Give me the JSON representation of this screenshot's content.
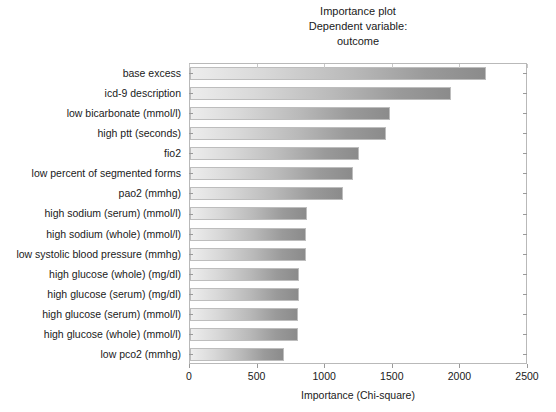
{
  "chart_data": {
    "type": "bar",
    "orientation": "horizontal",
    "title": "Importance plot\nDependent variable:\noutcome",
    "title_lines": [
      "Importance plot",
      "Dependent variable:",
      "outcome"
    ],
    "xlabel": "Importance (Chi-square)",
    "ylabel": "",
    "xlim": [
      0,
      2500
    ],
    "xticks": [
      0,
      500,
      1000,
      1500,
      2000,
      2500
    ],
    "xtick_labels": [
      "0",
      "500",
      "1000",
      "1500",
      "2000",
      "2500"
    ],
    "grid": false,
    "legend": null,
    "bar_color_start": "#ededed",
    "bar_color_end": "#8b8b8b",
    "categories": [
      "base excess",
      "icd-9 description",
      "low bicarbonate (mmol/l)",
      "high ptt (seconds)",
      "fio2",
      "low percent of segmented forms",
      "pao2 (mmhg)",
      "high sodium (serum) (mmol/l)",
      "high sodium (whole) (mmol/l)",
      "low systolic blood pressure (mmhg)",
      "high glucose (whole) (mg/dl)",
      "high glucose (serum) (mg/dl)",
      "high glucose (serum) (mmol/l)",
      "high glucose (whole) (mmol/l)",
      "low pco2 (mmhg)"
    ],
    "values": [
      2190,
      1930,
      1480,
      1450,
      1250,
      1205,
      1130,
      865,
      860,
      860,
      805,
      805,
      800,
      800,
      695
    ]
  },
  "figure": {
    "background": "#ffffff",
    "axis_color": "#b9b9b9",
    "text_color": "#1a1a1a"
  }
}
